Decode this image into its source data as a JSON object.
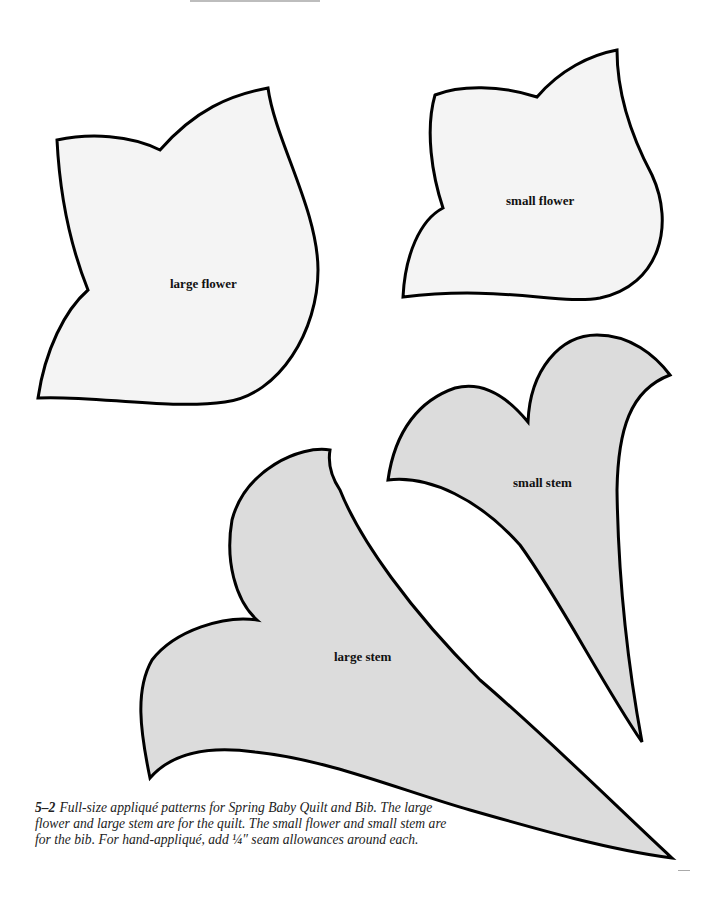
{
  "figure": {
    "number": "5–2",
    "caption": "Full-size appliqué patterns for Spring Baby Quilt and Bib. The large flower and large stem are for the quilt. The small flower and small stem are for the bib. For hand-appliqué, add ¼″ seam allowances around each."
  },
  "patterns": [
    {
      "id": "large-flower",
      "label": "large flower",
      "fill": "#f4f4f4"
    },
    {
      "id": "small-flower",
      "label": "small flower",
      "fill": "#f4f4f4"
    },
    {
      "id": "small-stem",
      "label": "small stem",
      "fill": "#dcdcdc"
    },
    {
      "id": "large-stem",
      "label": "large stem",
      "fill": "#dcdcdc"
    }
  ],
  "colors": {
    "outline": "#000000",
    "flower_fill": "#f4f4f4",
    "stem_fill": "#dcdcdc",
    "background": "#ffffff"
  }
}
